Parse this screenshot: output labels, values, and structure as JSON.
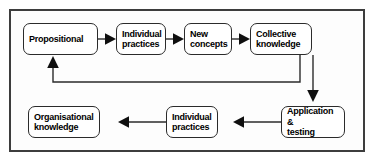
{
  "diagram": {
    "border_color": "#3d3d3d",
    "node_border_color": "#2b2b2b",
    "arrow_color": "#0f0f0f",
    "background": "#ffffff",
    "nodes": [
      {
        "id": "propositional",
        "label": "Propositional",
        "row": "top",
        "order": 1
      },
      {
        "id": "individual-practices-1",
        "label": "Individual\npractices",
        "row": "top",
        "order": 2
      },
      {
        "id": "new-concepts",
        "label": "New\nconcepts",
        "row": "top",
        "order": 3
      },
      {
        "id": "collective-knowledge",
        "label": "Collective\nknowledge",
        "row": "top",
        "order": 4
      },
      {
        "id": "application-testing",
        "label": "Application &\ntesting",
        "row": "bottom",
        "order": 5
      },
      {
        "id": "individual-practices-2",
        "label": "Individual\npractices",
        "row": "bottom",
        "order": 6
      },
      {
        "id": "organisational-knowledge",
        "label": "Organisational\nknowledge",
        "row": "bottom",
        "order": 7
      }
    ],
    "edges": [
      {
        "id": "e1",
        "from": "propositional",
        "to": "individual-practices-1",
        "direction": "right"
      },
      {
        "id": "e2",
        "from": "individual-practices-1",
        "to": "new-concepts",
        "direction": "right"
      },
      {
        "id": "e3",
        "from": "new-concepts",
        "to": "collective-knowledge",
        "direction": "right"
      },
      {
        "id": "e4",
        "from": "collective-knowledge",
        "to": "application-testing",
        "direction": "down"
      },
      {
        "id": "e5",
        "from": "application-testing",
        "to": "individual-practices-2",
        "direction": "left"
      },
      {
        "id": "e6",
        "from": "individual-practices-2",
        "to": "organisational-knowledge",
        "direction": "left"
      },
      {
        "id": "e7",
        "from": "collective-knowledge",
        "to": "propositional",
        "direction": "feedback-up"
      }
    ]
  }
}
